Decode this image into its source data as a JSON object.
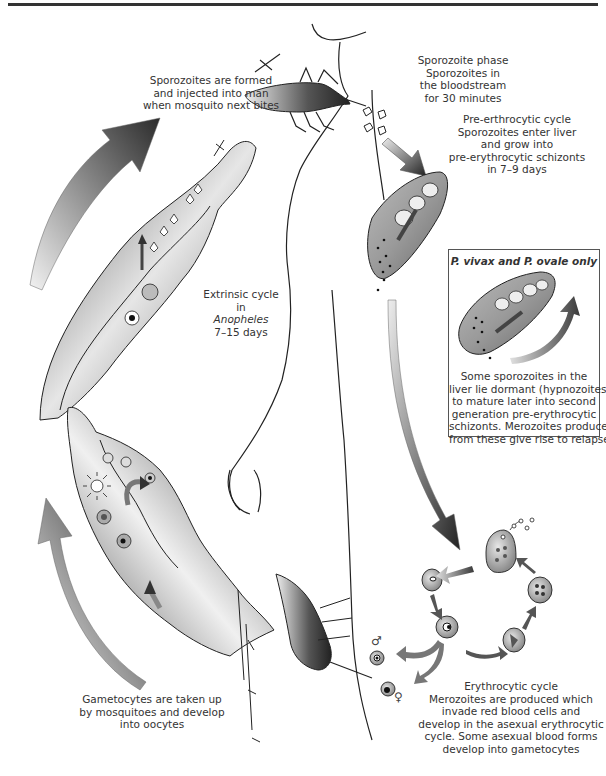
{
  "figure": {
    "labels": {
      "sporozoites_formed": {
        "lines": [
          "Sporozoites are formed",
          "and injected into man",
          "when mosquito next bites"
        ]
      },
      "sporozoite_phase": {
        "lines": [
          "Sporozoite phase",
          "Sporozoites in",
          "the bloodstream",
          "for 30 minutes"
        ]
      },
      "pre_erythrocytic": {
        "lines": [
          "Pre-erthrocytic cycle",
          "Sporozoites enter liver",
          "and grow into",
          "pre-erythrocytic schizonts",
          "in 7–9 days"
        ]
      },
      "extrinsic": {
        "lines": [
          "Extrinsic cycle",
          "in",
          "Anopheles",
          "7–15 days"
        ]
      },
      "gametocytes": {
        "lines": [
          "Gametocytes are taken up",
          "by mosquitoes and develop",
          "into oocytes"
        ]
      },
      "erythrocytic": {
        "lines": [
          "Erythrocytic cycle",
          "Merozoites are produced which",
          "invade red blood cells and",
          "develop in the asexual erythrocytic",
          "cycle. Some asexual blood forms",
          "develop into gametocytes"
        ]
      }
    },
    "inset_box": {
      "title": "P. vivax and P. ovale only",
      "lines": [
        "Some sporozoites in the",
        "liver lie dormant (hypnozoites)",
        "to mature later into second",
        "generation pre-erythrocytic",
        "schizonts. Merozoites produced",
        "from these give rise to relapses"
      ]
    },
    "symbols": {
      "male": "♂",
      "female": "♀"
    },
    "colors": {
      "ink": "#2a2a2a",
      "arrow_dark": "#2e2e2e",
      "arrow_light": "#d8d8d8",
      "tissue_mid": "#8a8a8a",
      "background": "#ffffff"
    }
  }
}
